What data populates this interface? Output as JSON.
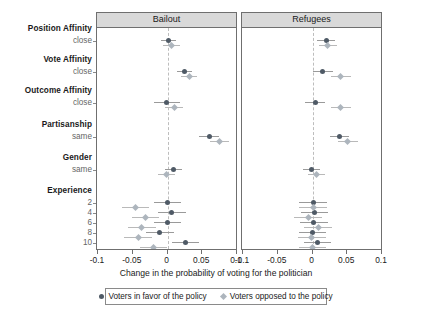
{
  "chart_data": {
    "type": "scatter",
    "title": "",
    "xlabel": "Change in the probability of voting for the politician",
    "ylabel": "",
    "xlim": [
      -0.1,
      0.1
    ],
    "xticks": [
      -0.1,
      -0.05,
      0,
      0.05,
      0.1
    ],
    "xticklabels": [
      "-0.1",
      "-0.05",
      "0",
      "0.05",
      "0.1"
    ],
    "grid": false,
    "zero_reference_line": 0,
    "legend_position": "bottom",
    "panels": [
      {
        "label": "Bailout"
      },
      {
        "label": "Refugees"
      }
    ],
    "series": [
      {
        "name": "Voters in favor of the policy",
        "marker": "circle",
        "color": "#4f5a66"
      },
      {
        "name": "Voters opposed to the policy",
        "marker": "diamond",
        "color": "#adb5bd"
      }
    ],
    "groups": [
      {
        "name": "Position Affinity",
        "sub": "close"
      },
      {
        "name": "Vote Affinity",
        "sub": "close"
      },
      {
        "name": "Outcome Affinity",
        "sub": "close"
      },
      {
        "name": "Partisanship",
        "sub": "same"
      },
      {
        "name": "Gender",
        "sub": "same"
      },
      {
        "name": "Experience",
        "sub": ""
      }
    ],
    "experience_levels": [
      "2",
      "4",
      "6",
      "8",
      "10"
    ],
    "estimates": {
      "Bailout": {
        "favor": [
          {
            "row": "Position Affinity close",
            "est": 0.001,
            "lo": -0.009,
            "hi": 0.012
          },
          {
            "row": "Vote Affinity close",
            "est": 0.024,
            "lo": 0.013,
            "hi": 0.035
          },
          {
            "row": "Outcome Affinity close",
            "est": -0.001,
            "lo": -0.02,
            "hi": 0.018
          },
          {
            "row": "Partisanship same",
            "est": 0.06,
            "lo": 0.046,
            "hi": 0.074
          },
          {
            "row": "Gender same",
            "est": 0.009,
            "lo": -0.003,
            "hi": 0.021
          },
          {
            "row": "Experience 2",
            "est": 0.0,
            "lo": -0.02,
            "hi": 0.02
          },
          {
            "row": "Experience 4",
            "est": 0.006,
            "lo": -0.013,
            "hi": 0.026
          },
          {
            "row": "Experience 6",
            "est": 0.0,
            "lo": -0.02,
            "hi": 0.02
          },
          {
            "row": "Experience 8",
            "est": -0.011,
            "lo": -0.031,
            "hi": 0.009
          },
          {
            "row": "Experience 10",
            "est": 0.026,
            "lo": 0.007,
            "hi": 0.046
          }
        ],
        "opposed": [
          {
            "row": "Position Affinity close",
            "est": 0.006,
            "lo": -0.006,
            "hi": 0.018
          },
          {
            "row": "Vote Affinity close",
            "est": 0.031,
            "lo": 0.019,
            "hi": 0.043
          },
          {
            "row": "Outcome Affinity close",
            "est": 0.01,
            "lo": -0.003,
            "hi": 0.023
          },
          {
            "row": "Partisanship same",
            "est": 0.075,
            "lo": 0.061,
            "hi": 0.089
          },
          {
            "row": "Gender same",
            "est": -0.001,
            "lo": -0.013,
            "hi": 0.011
          },
          {
            "row": "Experience 2",
            "est": -0.046,
            "lo": -0.066,
            "hi": -0.026
          },
          {
            "row": "Experience 4",
            "est": -0.032,
            "lo": -0.051,
            "hi": -0.012
          },
          {
            "row": "Experience 6",
            "est": -0.037,
            "lo": -0.057,
            "hi": -0.017
          },
          {
            "row": "Experience 8",
            "est": -0.042,
            "lo": -0.062,
            "hi": -0.022
          },
          {
            "row": "Experience 10",
            "est": -0.02,
            "lo": -0.04,
            "hi": -0.001
          }
        ]
      },
      "Refugees": {
        "favor": [
          {
            "row": "Position Affinity close",
            "est": 0.02,
            "lo": 0.006,
            "hi": 0.033
          },
          {
            "row": "Vote Affinity close",
            "est": 0.015,
            "lo": 0.001,
            "hi": 0.029
          },
          {
            "row": "Outcome Affinity close",
            "est": 0.004,
            "lo": -0.011,
            "hi": 0.018
          },
          {
            "row": "Partisanship same",
            "est": 0.039,
            "lo": 0.025,
            "hi": 0.053
          },
          {
            "row": "Gender same",
            "est": -0.001,
            "lo": -0.013,
            "hi": 0.011
          },
          {
            "row": "Experience 2",
            "est": 0.001,
            "lo": -0.019,
            "hi": 0.021
          },
          {
            "row": "Experience 4",
            "est": 0.003,
            "lo": -0.016,
            "hi": 0.023
          },
          {
            "row": "Experience 6",
            "est": 0.002,
            "lo": -0.018,
            "hi": 0.022
          },
          {
            "row": "Experience 8",
            "est": 0.0,
            "lo": -0.02,
            "hi": 0.02
          },
          {
            "row": "Experience 10",
            "est": 0.007,
            "lo": -0.012,
            "hi": 0.027
          }
        ],
        "opposed": [
          {
            "row": "Position Affinity close",
            "est": 0.022,
            "lo": 0.009,
            "hi": 0.035
          },
          {
            "row": "Vote Affinity close",
            "est": 0.041,
            "lo": 0.027,
            "hi": 0.055
          },
          {
            "row": "Outcome Affinity close",
            "est": 0.041,
            "lo": 0.027,
            "hi": 0.055
          },
          {
            "row": "Partisanship same",
            "est": 0.051,
            "lo": 0.037,
            "hi": 0.065
          },
          {
            "row": "Gender same",
            "est": 0.006,
            "lo": -0.006,
            "hi": 0.018
          },
          {
            "row": "Experience 2",
            "est": 0.001,
            "lo": -0.019,
            "hi": 0.021
          },
          {
            "row": "Experience 4",
            "est": -0.006,
            "lo": -0.026,
            "hi": 0.014
          },
          {
            "row": "Experience 6",
            "est": 0.008,
            "lo": -0.012,
            "hi": 0.028
          },
          {
            "row": "Experience 8",
            "est": -0.001,
            "lo": -0.021,
            "hi": 0.019
          },
          {
            "row": "Experience 10",
            "est": 0.0,
            "lo": -0.02,
            "hi": 0.02
          }
        ]
      }
    }
  }
}
